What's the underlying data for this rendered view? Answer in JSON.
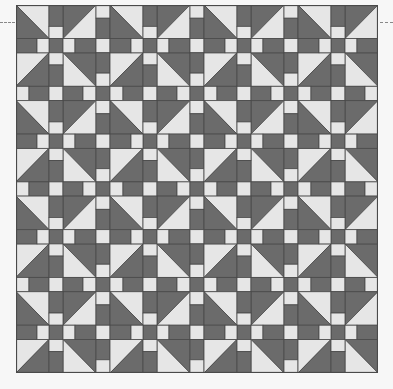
{
  "quilt": {
    "blocks_x": 4,
    "blocks_y": 4,
    "block_size": 80,
    "sash_size": 14,
    "corner_size": 33,
    "strip_parts": [
      21,
      12,
      14,
      12,
      21
    ],
    "sash_parts": [
      13,
      20,
      14,
      20,
      13
    ],
    "colors": {
      "dark": "#6b6b6b",
      "light": "#e6e6e6",
      "seam": "#4a4a4a",
      "background": "#f7f7f7"
    }
  },
  "guides": {
    "left_dash": "dashed-guide-left",
    "right_dash": "dashed-guide-right"
  }
}
